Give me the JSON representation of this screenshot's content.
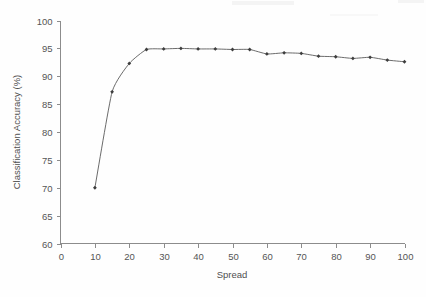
{
  "chart_data": {
    "type": "line",
    "title": "",
    "subtitle": "",
    "xlabel": "Spread",
    "ylabel": "Classification Accuracy (%)",
    "xlim": [
      0,
      100
    ],
    "ylim": [
      60,
      100
    ],
    "xticks": [
      0,
      10,
      20,
      30,
      40,
      50,
      60,
      70,
      80,
      90,
      100
    ],
    "yticks": [
      60,
      65,
      70,
      75,
      80,
      85,
      90,
      95,
      100
    ],
    "xtick_labels": [
      "0",
      "10",
      "20",
      "30",
      "40",
      "50",
      "60",
      "70",
      "80",
      "90",
      "100"
    ],
    "ytick_labels": [
      "60",
      "65",
      "70",
      "75",
      "80",
      "85",
      "90",
      "95",
      "100"
    ],
    "grid": false,
    "legend": null,
    "legend_position": "none",
    "marker": "diamond",
    "line_color": "#5a5a5a",
    "marker_color": "#3d3d3d",
    "axis_color": "#8c8c8c",
    "background_color": "#fefefe",
    "annotations": [],
    "x": [
      10,
      15,
      20,
      25,
      30,
      35,
      40,
      45,
      50,
      55,
      60,
      65,
      70,
      75,
      80,
      85,
      90,
      95,
      100
    ],
    "values": [
      70.0,
      87.2,
      92.3,
      94.8,
      94.9,
      95.0,
      94.9,
      94.9,
      94.8,
      94.8,
      94.0,
      94.2,
      94.1,
      93.6,
      93.5,
      93.2,
      93.4,
      92.9,
      92.6
    ],
    "series": [
      {
        "name": "Classification Accuracy",
        "x": [
          10,
          15,
          20,
          25,
          30,
          35,
          40,
          45,
          50,
          55,
          60,
          65,
          70,
          75,
          80,
          85,
          90,
          95,
          100
        ],
        "values": [
          70.0,
          87.2,
          92.3,
          94.8,
          94.9,
          95.0,
          94.9,
          94.9,
          94.8,
          94.8,
          94.0,
          94.2,
          94.1,
          93.6,
          93.5,
          93.2,
          93.4,
          92.9,
          92.6
        ]
      }
    ]
  }
}
